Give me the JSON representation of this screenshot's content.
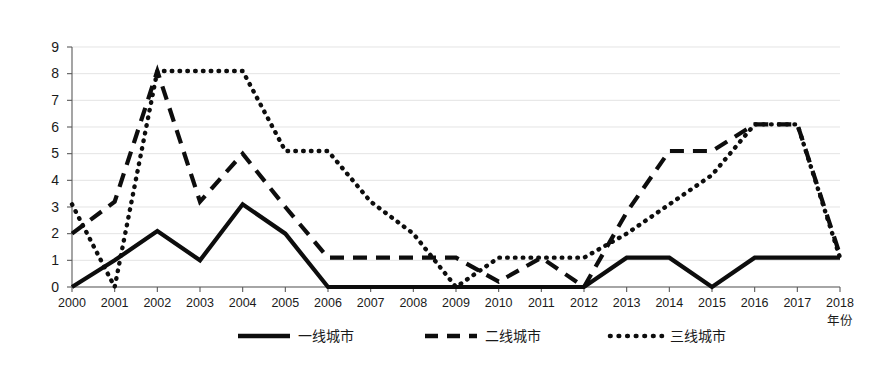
{
  "chart_data": {
    "type": "line",
    "title": "",
    "subtitle": "",
    "xlabel": "年份",
    "ylabel": "",
    "xlim": [
      2000,
      2018
    ],
    "ylim": [
      0,
      9
    ],
    "grid": true,
    "legend_position": "bottom-center",
    "categories": [
      "2000",
      "2001",
      "2002",
      "2003",
      "2004",
      "2005",
      "2006",
      "2007",
      "2008",
      "2009",
      "2010",
      "2011",
      "2012",
      "2013",
      "2014",
      "2015",
      "2016",
      "2017",
      "2018"
    ],
    "x": [
      2000,
      2001,
      2002,
      2003,
      2004,
      2005,
      2006,
      2007,
      2008,
      2009,
      2010,
      2011,
      2012,
      2013,
      2014,
      2015,
      2016,
      2017,
      2018
    ],
    "yticks": [
      "0",
      "1",
      "2",
      "3",
      "4",
      "5",
      "6",
      "7",
      "8",
      "9"
    ],
    "series": [
      {
        "name": "一线城市",
        "style": "solid",
        "color": "#0d0d0d",
        "values": [
          0,
          1.0,
          2.1,
          1.0,
          3.1,
          2.0,
          0,
          0,
          0,
          0,
          0,
          0,
          0,
          1.1,
          1.1,
          0,
          1.1,
          1.1,
          1.1
        ]
      },
      {
        "name": "二线城市",
        "style": "dashed",
        "color": "#0d0d0d",
        "values": [
          2.0,
          3.2,
          8.1,
          3.2,
          5.0,
          3.0,
          1.1,
          1.1,
          1.1,
          1.1,
          0.2,
          1.1,
          0,
          2.8,
          5.1,
          5.1,
          6.1,
          6.1,
          1.2
        ]
      },
      {
        "name": "三线城市",
        "style": "dotted",
        "color": "#0d0d0d",
        "values": [
          3.1,
          0,
          8.1,
          8.1,
          8.1,
          5.1,
          5.1,
          3.2,
          2.0,
          0,
          1.1,
          1.1,
          1.1,
          2.0,
          3.1,
          4.2,
          6.1,
          6.1,
          1.1
        ]
      }
    ],
    "legend": [
      {
        "label": "一线城市",
        "style": "solid"
      },
      {
        "label": "二线城市",
        "style": "dashed"
      },
      {
        "label": "三线城市",
        "style": "dotted"
      }
    ]
  }
}
